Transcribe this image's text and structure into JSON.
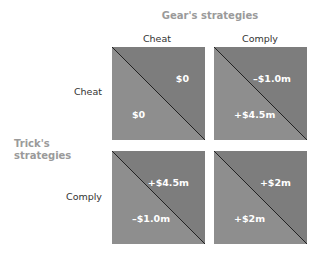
{
  "column_player": {
    "title": "Gear's strategies",
    "strategies": [
      "Cheat",
      "Comply"
    ]
  },
  "row_player": {
    "title": "Trick's strategies",
    "strategies": [
      "Cheat",
      "Comply"
    ]
  },
  "colors": {
    "upper_triangle": "#7d7d7d",
    "lower_triangle": "#8e8e8e",
    "diagonal": "#222222",
    "label_gray": "#9a9a9a"
  },
  "cells": [
    {
      "row": "Cheat",
      "col": "Cheat",
      "gear_payoff": "$0",
      "trick_payoff": "$0"
    },
    {
      "row": "Cheat",
      "col": "Comply",
      "gear_payoff": "–$1.0m",
      "trick_payoff": "+$4.5m"
    },
    {
      "row": "Comply",
      "col": "Cheat",
      "gear_payoff": "+$4.5m",
      "trick_payoff": "–$1.0m"
    },
    {
      "row": "Comply",
      "col": "Comply",
      "gear_payoff": "+$2m",
      "trick_payoff": "+$2m"
    }
  ]
}
